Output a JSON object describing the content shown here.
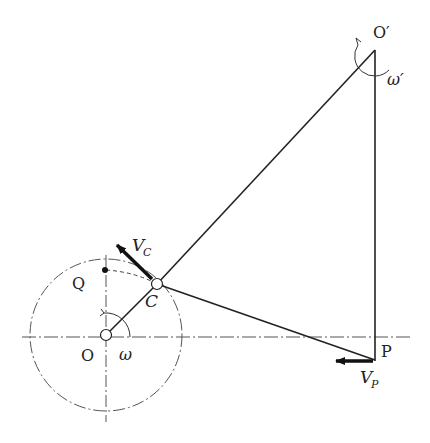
{
  "diagram": {
    "type": "mechanism-velocity-diagram",
    "points": {
      "O": {
        "label": "O",
        "x": 106,
        "y": 335
      },
      "C": {
        "label": "C",
        "x": 157,
        "y": 284
      },
      "O_prime": {
        "label": "O′",
        "x": 375,
        "y": 50
      },
      "P": {
        "label": "P",
        "x": 375,
        "y": 360
      },
      "Q": {
        "label": "Q",
        "x": 106,
        "y": 270
      }
    },
    "labels": {
      "O": "O",
      "C": "C",
      "O_prime": "O′",
      "P": "P",
      "Q": "Q",
      "omega": "ω",
      "omega_prime": "ω′",
      "V_C_main": "V",
      "V_C_sub": "C",
      "V_P_main": "V",
      "V_P_sub": "P"
    },
    "colors": {
      "line": "#222222",
      "dash": "#555555"
    }
  }
}
